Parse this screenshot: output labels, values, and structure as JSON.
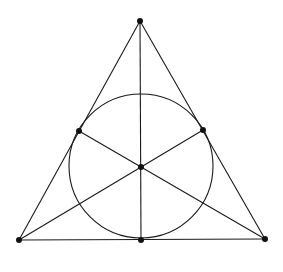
{
  "diagram": {
    "title": "",
    "type": "fano-plane",
    "colors": {
      "background": "#ffffff",
      "stroke": "#1a1a1a",
      "point": "#111111"
    },
    "points": [
      {
        "id": "top",
        "x": 140,
        "y": 21
      },
      {
        "id": "bottom-left",
        "x": 19,
        "y": 240
      },
      {
        "id": "bottom-right",
        "x": 265,
        "y": 239
      },
      {
        "id": "left-mid",
        "x": 79,
        "y": 131
      },
      {
        "id": "right-mid",
        "x": 203,
        "y": 130
      },
      {
        "id": "bottom-mid",
        "x": 141,
        "y": 240
      },
      {
        "id": "center",
        "x": 141,
        "y": 167
      }
    ],
    "lines": [
      [
        "top",
        "bottom-left"
      ],
      [
        "top",
        "bottom-right"
      ],
      [
        "bottom-left",
        "bottom-right"
      ],
      [
        "top",
        "bottom-mid"
      ],
      [
        "left-mid",
        "bottom-right"
      ],
      [
        "right-mid",
        "bottom-left"
      ]
    ],
    "circle": {
      "cx": 141,
      "cy": 166,
      "r": 72
    }
  }
}
